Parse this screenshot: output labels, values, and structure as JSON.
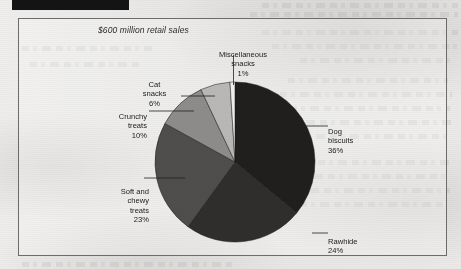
{
  "page": {
    "type": "scanned-document-page",
    "black_bar": true
  },
  "chart_data": {
    "type": "pie",
    "title": "",
    "caption": "$600 million retail sales",
    "total_label": "$600 million retail sales",
    "units": "percent",
    "legend": "callout-labels",
    "start_angle_deg": 0,
    "direction": "clockwise",
    "categories": [
      "Dog biscuits",
      "Rawhide",
      "Soft and chewy treats",
      "Crunchy treats",
      "Cat snacks",
      "Miscellaneous snacks"
    ],
    "values": [
      36,
      24,
      23,
      10,
      6,
      1
    ],
    "value_labels": [
      "36%",
      "24%",
      "23%",
      "10%",
      "6%",
      "1%"
    ],
    "colors": [
      "#201f1e",
      "#2f2e2c",
      "#4f4e4c",
      "#8d8c8a",
      "#b9b8b6",
      "#efefed"
    ],
    "slices": [
      {
        "name": "Dog biscuits",
        "label": "Dog\nbiscuits",
        "pct": "36%",
        "value": 36,
        "color": "#201f1e"
      },
      {
        "name": "Rawhide",
        "label": "Rawhide",
        "pct": "24%",
        "value": 24,
        "color": "#2f2e2c"
      },
      {
        "name": "Soft and chewy treats",
        "label": "Soft and\nchewy\ntreats",
        "pct": "23%",
        "value": 23,
        "color": "#4f4e4c"
      },
      {
        "name": "Crunchy treats",
        "label": "Crunchy\ntreats",
        "pct": "10%",
        "value": 10,
        "color": "#8d8c8a"
      },
      {
        "name": "Cat snacks",
        "label": "Cat\nsnacks",
        "pct": "6%",
        "value": 6,
        "color": "#b9b8b6"
      },
      {
        "name": "Miscellaneous snacks",
        "label": "Miscellaneous\nsnacks",
        "pct": "1%",
        "value": 1,
        "color": "#efefed"
      }
    ]
  }
}
